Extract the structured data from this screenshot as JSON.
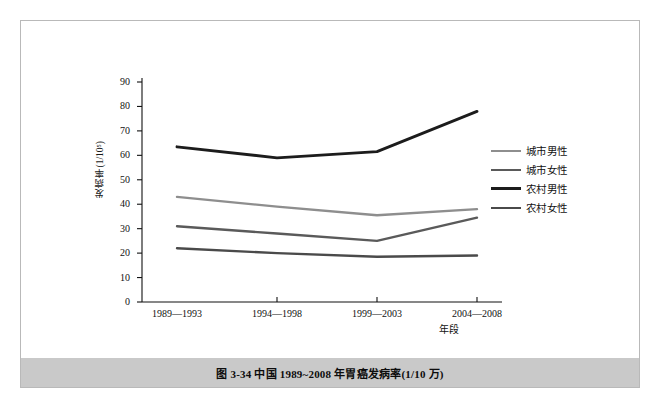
{
  "figure": {
    "caption": "图 3-34    中国 1989~2008 年胃癌发病率(1/10 万)"
  },
  "chart_data": {
    "type": "line",
    "title": "",
    "xlabel": "年段",
    "ylabel": "发病率(1/10⁵)",
    "categories": [
      "1989—1993",
      "1994—1998",
      "1999—2003",
      "2004—2008"
    ],
    "ylim": [
      0,
      90
    ],
    "yticks": [
      0,
      10,
      20,
      30,
      40,
      50,
      60,
      70,
      80,
      90
    ],
    "grid": false,
    "legend_position": "right",
    "series": [
      {
        "name": "城市男性",
        "color": "#8e8e8e",
        "width": 2.4,
        "values": [
          43.0,
          39.0,
          35.5,
          38.0
        ]
      },
      {
        "name": "城市女性",
        "color": "#5a5a5a",
        "width": 2.4,
        "values": [
          31.0,
          28.0,
          25.0,
          34.5
        ]
      },
      {
        "name": "农村男性",
        "color": "#1c1c1c",
        "width": 2.8,
        "values": [
          63.5,
          59.0,
          61.5,
          78.0
        ]
      },
      {
        "name": "农村女性",
        "color": "#4a4a4a",
        "width": 2.4,
        "values": [
          22.0,
          20.0,
          18.5,
          19.0
        ]
      }
    ]
  },
  "axis": {
    "tick_color": "#111111",
    "axis_color": "#111111"
  }
}
